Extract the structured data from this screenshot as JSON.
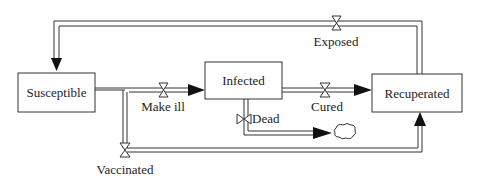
{
  "diagram": {
    "type": "stock-and-flow",
    "stocks": [
      {
        "id": "susceptible",
        "label": "Susceptible"
      },
      {
        "id": "infected",
        "label": "Infected"
      },
      {
        "id": "recuperated",
        "label": "Recuperated"
      }
    ],
    "flows": [
      {
        "id": "exposed",
        "label": "Exposed",
        "from": "Recuperated",
        "to": "Susceptible"
      },
      {
        "id": "make_ill",
        "label": "Make ill",
        "from": "Susceptible",
        "to": "Infected"
      },
      {
        "id": "cured",
        "label": "Cured",
        "from": "Infected",
        "to": "Recuperated"
      },
      {
        "id": "dead",
        "label": "Dead",
        "from": "Infected",
        "to": "cloud-sink"
      },
      {
        "id": "vaccinated",
        "label": "Vaccinated",
        "from": "Susceptible",
        "to": "Recuperated"
      }
    ],
    "colors": {
      "line": "#333333",
      "box_fill": "#ffffff",
      "background": "#ffffff"
    }
  }
}
